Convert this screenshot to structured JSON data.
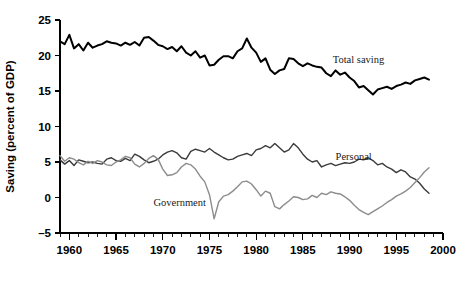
{
  "chart_data": {
    "type": "line",
    "title": "",
    "xlabel": "",
    "ylabel": "Saving (percent of GDP)",
    "xlim": [
      1959,
      2000
    ],
    "ylim": [
      -5,
      25
    ],
    "grid": false,
    "legend_position": "inline-annotations",
    "y_ticks": [
      -5,
      0,
      5,
      10,
      15,
      20,
      25
    ],
    "y_tick_labels": [
      "–5",
      "0",
      "5",
      "10",
      "15",
      "20",
      "25"
    ],
    "x_ticks": [
      1960,
      1965,
      1970,
      1975,
      1980,
      1985,
      1990,
      1995,
      2000
    ],
    "x_tick_labels": [
      "1960",
      "1965",
      "1970",
      "1975",
      "1980",
      "1985",
      "1990",
      "1995",
      "2000"
    ],
    "x_minor_tick_interval": 1,
    "series": [
      {
        "name": "Total saving",
        "color": "#000000",
        "width": 2.0,
        "label_x": 1988.2,
        "label_y": 19.0,
        "x": [
          1959,
          1959.5,
          1960,
          1960.5,
          1961,
          1961.5,
          1962,
          1962.5,
          1963,
          1963.5,
          1964,
          1964.5,
          1965,
          1965.5,
          1966,
          1966.5,
          1967,
          1967.5,
          1968,
          1968.5,
          1969,
          1969.5,
          1970,
          1970.5,
          1971,
          1971.5,
          1972,
          1972.5,
          1973,
          1973.5,
          1974,
          1974.5,
          1975,
          1975.5,
          1976,
          1976.5,
          1977,
          1977.5,
          1978,
          1978.5,
          1979,
          1979.5,
          1980,
          1980.5,
          1981,
          1981.5,
          1982,
          1982.5,
          1983,
          1983.5,
          1984,
          1984.5,
          1985,
          1985.5,
          1986,
          1986.5,
          1987,
          1987.5,
          1988,
          1988.5,
          1989,
          1989.5,
          1990,
          1990.5,
          1991,
          1991.5,
          1992,
          1992.5,
          1993,
          1993.5,
          1994,
          1994.5,
          1995,
          1995.5,
          1996,
          1996.5,
          1997,
          1997.5,
          1998,
          1998.5
        ],
        "y": [
          22.0,
          21.6,
          22.9,
          21.0,
          21.6,
          20.7,
          21.8,
          21.1,
          21.4,
          21.6,
          22.0,
          21.8,
          21.7,
          21.4,
          21.8,
          21.5,
          21.9,
          21.4,
          22.5,
          22.6,
          22.1,
          21.5,
          21.3,
          20.9,
          21.2,
          20.6,
          21.3,
          20.4,
          20.0,
          20.6,
          19.7,
          20.0,
          18.6,
          18.7,
          19.4,
          19.9,
          19.9,
          19.6,
          20.6,
          21.0,
          22.4,
          21.1,
          20.4,
          19.1,
          19.6,
          18.0,
          17.4,
          17.9,
          18.1,
          19.6,
          19.5,
          18.9,
          18.5,
          18.9,
          18.6,
          18.4,
          18.3,
          17.5,
          17.1,
          17.9,
          17.3,
          17.6,
          16.9,
          16.4,
          15.5,
          15.7,
          15.1,
          14.5,
          15.2,
          15.4,
          15.6,
          15.3,
          15.7,
          15.9,
          16.2,
          16.0,
          16.5,
          16.7,
          16.9,
          16.6
        ]
      },
      {
        "name": "Personal",
        "color": "#3a3a3a",
        "width": 1.4,
        "label_x": 1988.5,
        "label_y": 5.3,
        "x": [
          1959,
          1959.5,
          1960,
          1960.5,
          1961,
          1961.5,
          1962,
          1962.5,
          1963,
          1963.5,
          1964,
          1964.5,
          1965,
          1965.5,
          1966,
          1966.5,
          1967,
          1967.5,
          1968,
          1968.5,
          1969,
          1969.5,
          1970,
          1970.5,
          1971,
          1971.5,
          1972,
          1972.5,
          1973,
          1973.5,
          1974,
          1974.5,
          1975,
          1975.5,
          1976,
          1976.5,
          1977,
          1977.5,
          1978,
          1978.5,
          1979,
          1979.5,
          1980,
          1980.5,
          1981,
          1981.5,
          1982,
          1982.5,
          1983,
          1983.5,
          1984,
          1984.5,
          1985,
          1985.5,
          1986,
          1986.5,
          1987,
          1987.5,
          1988,
          1988.5,
          1989,
          1989.5,
          1990,
          1990.5,
          1991,
          1991.5,
          1992,
          1992.5,
          1993,
          1993.5,
          1994,
          1994.5,
          1995,
          1995.5,
          1996,
          1996.5,
          1997,
          1997.5,
          1998,
          1998.5
        ],
        "y": [
          5.3,
          4.7,
          5.2,
          4.5,
          5.3,
          5.1,
          4.9,
          5.0,
          4.8,
          4.7,
          5.4,
          5.6,
          5.2,
          5.1,
          5.5,
          5.2,
          6.1,
          5.8,
          5.3,
          4.9,
          5.1,
          5.4,
          6.0,
          6.4,
          6.6,
          6.3,
          5.6,
          5.4,
          6.5,
          6.8,
          6.6,
          6.4,
          6.9,
          6.4,
          6.0,
          5.6,
          5.3,
          5.4,
          5.8,
          6.0,
          6.2,
          5.9,
          6.7,
          6.9,
          7.3,
          7.0,
          7.6,
          7.0,
          6.4,
          6.7,
          7.6,
          7.0,
          6.1,
          5.4,
          5.0,
          5.2,
          4.3,
          4.6,
          4.8,
          4.5,
          4.7,
          4.9,
          4.8,
          5.0,
          5.4,
          5.3,
          5.6,
          5.2,
          4.6,
          4.8,
          4.3,
          4.0,
          3.5,
          3.9,
          3.6,
          2.9,
          2.6,
          2.0,
          1.2,
          0.6
        ]
      },
      {
        "name": "Government",
        "color": "#8c8c8c",
        "width": 1.4,
        "label_x": 1969.0,
        "label_y": -1.2,
        "x": [
          1959,
          1959.5,
          1960,
          1960.5,
          1961,
          1961.5,
          1962,
          1962.5,
          1963,
          1963.5,
          1964,
          1964.5,
          1965,
          1965.5,
          1966,
          1966.5,
          1967,
          1967.5,
          1968,
          1968.5,
          1969,
          1969.5,
          1970,
          1970.5,
          1971,
          1971.5,
          1972,
          1972.5,
          1973,
          1973.5,
          1974,
          1974.5,
          1975,
          1975.5,
          1976,
          1976.5,
          1977,
          1977.5,
          1978,
          1978.5,
          1979,
          1979.5,
          1980,
          1980.5,
          1981,
          1981.5,
          1982,
          1982.5,
          1983,
          1983.5,
          1984,
          1984.5,
          1985,
          1985.5,
          1986,
          1986.5,
          1987,
          1987.5,
          1988,
          1988.5,
          1989,
          1989.5,
          1990,
          1990.5,
          1991,
          1991.5,
          1992,
          1992.5,
          1993,
          1993.5,
          1994,
          1994.5,
          1995,
          1995.5,
          1996,
          1996.5,
          1997,
          1997.5,
          1998,
          1998.5
        ],
        "y": [
          5.9,
          5.1,
          5.6,
          5.4,
          4.9,
          4.6,
          5.1,
          4.8,
          5.2,
          5.0,
          4.6,
          4.5,
          5.0,
          5.3,
          5.8,
          5.6,
          4.7,
          4.3,
          4.8,
          5.5,
          5.9,
          5.4,
          4.0,
          3.1,
          3.2,
          3.5,
          4.3,
          4.8,
          4.6,
          4.0,
          3.0,
          2.2,
          0.4,
          -3.0,
          -0.6,
          0.2,
          0.4,
          0.9,
          1.5,
          2.2,
          2.3,
          1.9,
          1.1,
          0.2,
          0.9,
          0.6,
          -1.3,
          -1.6,
          -1.0,
          -0.5,
          0.1,
          0.0,
          -0.3,
          -0.2,
          0.3,
          0.0,
          0.6,
          0.4,
          0.8,
          0.6,
          0.5,
          0.1,
          -0.4,
          -1.1,
          -1.7,
          -2.1,
          -2.4,
          -2.0,
          -1.6,
          -1.2,
          -0.7,
          -0.3,
          0.2,
          0.5,
          0.9,
          1.4,
          2.1,
          2.8,
          3.6,
          4.2
        ]
      }
    ]
  },
  "annotations": {
    "total_saving_label": "Total saving",
    "personal_label": "Personal",
    "government_label": "Government"
  }
}
